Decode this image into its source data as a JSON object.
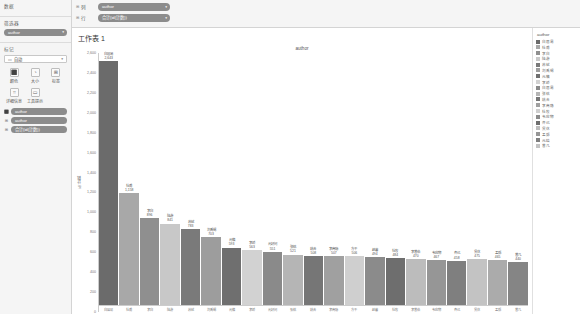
{
  "sidebar": {
    "data_section": {
      "title": "数据"
    },
    "filters_section": {
      "title": "筛选器",
      "pills": [
        {
          "label": "author",
          "caret": "▾"
        }
      ]
    },
    "marks_section": {
      "title": "标记",
      "dropdown": {
        "icon": "▭",
        "value": "自动",
        "caret": "▾"
      },
      "buttons": [
        {
          "icon": "⬛",
          "label": "颜色",
          "name": "color"
        },
        {
          "icon": "◔",
          "label": "大小",
          "name": "size"
        },
        {
          "icon": "⊞",
          "label": "标签",
          "name": "label"
        },
        {
          "icon": "⌗",
          "label": "详细信息",
          "name": "detail"
        },
        {
          "icon": "▭",
          "label": "工具提示",
          "name": "tooltip"
        }
      ],
      "pills": [
        {
          "icon": "⬛",
          "label": "author"
        },
        {
          "icon": "⊞",
          "label": "author"
        },
        {
          "icon": "⊞",
          "label": "合计(id(计数))"
        }
      ]
    }
  },
  "shelves": [
    {
      "bullet": "⊞",
      "label": "列",
      "pill": "author",
      "caret": "▾"
    },
    {
      "bullet": "⊞",
      "label": "行",
      "pill": "合计(id(计数))",
      "caret": "▾"
    }
  ],
  "worksheet": {
    "title": "工作表 1"
  },
  "legend": {
    "title": "author",
    "items": [
      {
        "label": "白居易",
        "color": "#6b6b6b"
      },
      {
        "label": "杜甫",
        "color": "#a8a8a8"
      },
      {
        "label": "李白",
        "color": "#8f8f8f"
      },
      {
        "label": "陆游",
        "color": "#c8c8c8"
      },
      {
        "label": "苏轼",
        "color": "#7a7a7a"
      },
      {
        "label": "刘禹锡",
        "color": "#9d9d9d"
      },
      {
        "label": "元稹",
        "color": "#6f6f6f"
      },
      {
        "label": "李峤",
        "color": "#d2d2d2"
      },
      {
        "label": "白居易",
        "color": "#8a8a8a"
      },
      {
        "label": "张祜",
        "color": "#b5b5b5"
      },
      {
        "label": "姚合",
        "color": "#767676"
      },
      {
        "label": "李商隐",
        "color": "#a0a0a0"
      },
      {
        "label": "杜牧",
        "color": "#cfcfcf"
      },
      {
        "label": "韦应物",
        "color": "#8b8b8b"
      },
      {
        "label": "齐己",
        "color": "#6e6e6e"
      },
      {
        "label": "贯休",
        "color": "#bcbcbc"
      },
      {
        "label": "孟郊",
        "color": "#969696"
      },
      {
        "label": "元结",
        "color": "#7f7f7f"
      },
      {
        "label": "曾几",
        "color": "#c3c3c3"
      }
    ]
  },
  "chart_data": {
    "type": "bar",
    "title": "author",
    "xlabel": "author",
    "ylabel": "id 计数",
    "ylim": [
      0,
      2600
    ],
    "ytick_step": 200,
    "yticks": [
      2600,
      2400,
      2200,
      2000,
      1800,
      1600,
      1400,
      1200,
      1000,
      800,
      600,
      400,
      200,
      0
    ],
    "grid": false,
    "legend_position": "right",
    "categories": [
      "白居易",
      "杜甫",
      "李白",
      "陆游",
      "苏轼",
      "刘禹锡",
      "元稹",
      "李峤",
      "元好问",
      "张祜",
      "姚合",
      "李商隐",
      "方干",
      "赵蕃",
      "杜牧",
      "李曾伯",
      "韦应物",
      "齐己",
      "贯休",
      "孟郊",
      "曾几"
    ],
    "values": [
      2643,
      1158,
      896,
      841,
      783,
      703,
      593,
      563,
      551,
      521,
      508,
      507,
      506,
      494,
      484,
      470,
      467,
      458,
      475,
      465,
      440
    ],
    "labels": [
      "2,643",
      "1,158",
      "896",
      "841",
      "783",
      "703",
      "593",
      "563",
      "551",
      "521",
      "508",
      "507",
      "506",
      "494",
      "484",
      "470",
      "467",
      "458",
      "475",
      "465",
      "440"
    ],
    "colors": [
      "#6b6b6b",
      "#a8a8a8",
      "#8f8f8f",
      "#c8c8c8",
      "#7a7a7a",
      "#9d9d9d",
      "#6f6f6f",
      "#d2d2d2",
      "#8a8a8a",
      "#b5b5b5",
      "#767676",
      "#a0a0a0",
      "#cfcfcf",
      "#8b8b8b",
      "#6e6e6e",
      "#bcbcbc",
      "#969696",
      "#7f7f7f",
      "#c3c3c3",
      "#ababab",
      "#858585"
    ]
  }
}
